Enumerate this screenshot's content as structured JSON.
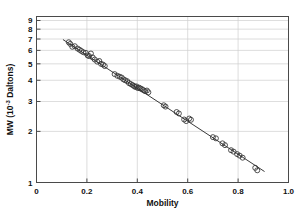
{
  "chart_data": {
    "type": "scatter",
    "title": "",
    "xlabel": "Mobility",
    "ylabel": "MW (10",
    "ylabel_sup": "-3",
    "ylabel_tail": " Daltons)",
    "ylabel_full": "MW (10-3 Daltons)",
    "xlim": [
      0,
      1.0
    ],
    "ylim": [
      1,
      9.5
    ],
    "yscale": "log",
    "xscale": "linear",
    "grid": true,
    "legend": "none",
    "xticks": [
      "0",
      "0.2",
      "0.4",
      "0.6",
      "0.8",
      "1.0"
    ],
    "xtick_values": [
      0,
      0.2,
      0.4,
      0.6,
      0.8,
      1.0
    ],
    "yticks": [
      "1",
      "2",
      "3",
      "4",
      "5",
      "6",
      "7",
      "8",
      "9"
    ],
    "ytick_values": [
      1,
      2,
      3,
      4,
      5,
      6,
      7,
      8,
      9
    ],
    "marker": "open-circle",
    "marker_color": "#333333",
    "line_color": "#222222",
    "fit_line": {
      "label": "linear regression on log(MW)",
      "x_start": 0.105,
      "y_start": 6.95,
      "x_end": 0.905,
      "y_end": 1.16
    },
    "x": [
      0.128,
      0.134,
      0.142,
      0.152,
      0.163,
      0.171,
      0.178,
      0.186,
      0.196,
      0.203,
      0.209,
      0.216,
      0.223,
      0.231,
      0.241,
      0.249,
      0.256,
      0.264,
      0.271,
      0.31,
      0.321,
      0.33,
      0.338,
      0.345,
      0.352,
      0.36,
      0.367,
      0.374,
      0.381,
      0.387,
      0.392,
      0.397,
      0.402,
      0.407,
      0.412,
      0.418,
      0.424,
      0.431,
      0.438,
      0.444,
      0.505,
      0.512,
      0.556,
      0.565,
      0.586,
      0.594,
      0.606,
      0.613,
      0.7,
      0.712,
      0.738,
      0.748,
      0.772,
      0.782,
      0.796,
      0.806,
      0.818,
      0.868,
      0.876
    ],
    "y": [
      6.7,
      6.55,
      6.3,
      6.35,
      6.15,
      6.05,
      5.95,
      5.85,
      5.8,
      5.6,
      5.55,
      5.75,
      5.45,
      5.3,
      5.15,
      5.2,
      5.0,
      4.95,
      4.85,
      4.35,
      4.25,
      4.2,
      4.15,
      4.05,
      4.0,
      3.95,
      3.85,
      3.8,
      3.75,
      3.7,
      3.65,
      3.68,
      3.6,
      3.62,
      3.58,
      3.55,
      3.5,
      3.45,
      3.48,
      3.4,
      2.85,
      2.8,
      2.6,
      2.55,
      2.35,
      2.3,
      2.38,
      2.34,
      1.85,
      1.82,
      1.7,
      1.66,
      1.55,
      1.52,
      1.47,
      1.44,
      1.4,
      1.22,
      1.18
    ]
  }
}
